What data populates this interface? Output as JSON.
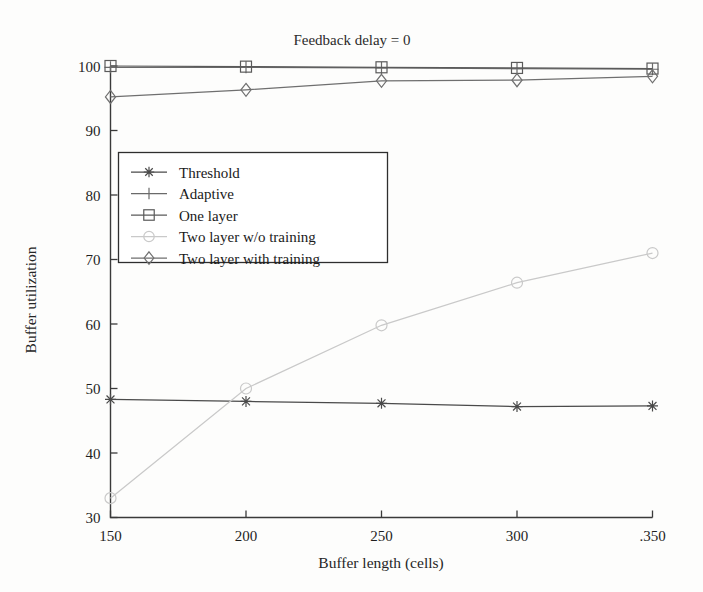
{
  "figure": {
    "kind": "scanned-line-plot"
  },
  "chart_data": {
    "type": "line",
    "title": "Feedback delay = 0",
    "xlabel": "Buffer length (cells)",
    "ylabel": "Buffer utilization",
    "x": [
      150,
      200,
      250,
      300,
      350
    ],
    "xtick_labels": [
      "150",
      "200",
      "250",
      "300",
      ".350"
    ],
    "ytick_labels": [
      "30",
      "40",
      "50",
      "60",
      "70",
      "80",
      "90",
      "100"
    ],
    "xlim": [
      150,
      350
    ],
    "ylim": [
      30,
      100
    ],
    "grid": false,
    "legend_position": "upper-left-inside",
    "series": [
      {
        "name": "Threshold",
        "marker": "star",
        "color": "#4a4a4a",
        "values": [
          48.3,
          48.0,
          47.7,
          47.2,
          47.3
        ]
      },
      {
        "name": "Adaptive",
        "marker": "plus",
        "color": "#6a6a6a",
        "values": [
          99.8,
          99.8,
          99.7,
          99.6,
          99.5
        ]
      },
      {
        "name": "One layer",
        "marker": "square",
        "color": "#5a5a5a",
        "values": [
          100.0,
          99.9,
          99.8,
          99.7,
          99.6
        ]
      },
      {
        "name": "Two layer w/o training",
        "marker": "circle",
        "color": "#c9c9c9",
        "values": [
          33.0,
          50.0,
          59.8,
          66.4,
          71.0
        ]
      },
      {
        "name": "Two layer with training",
        "marker": "diamond",
        "color": "#6f6f6f",
        "values": [
          95.2,
          96.3,
          97.7,
          97.8,
          98.4
        ]
      }
    ]
  }
}
